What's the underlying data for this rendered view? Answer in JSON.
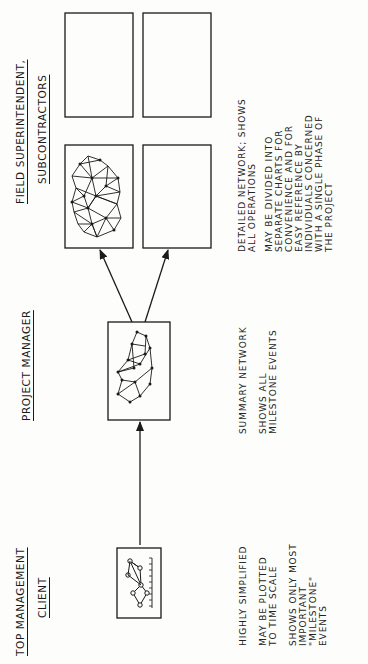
{
  "levels": [
    {
      "id": "client",
      "header_line1": "TOP MANAGEMENT",
      "header_line2": "CLIENT",
      "notes": [
        "HIGHLY SIMPLIFIED",
        "MAY BE PLOTTED\nTO TIME SCALE",
        "SHOWS ONLY MOST\nIMPORTANT\n\"MILESTONE\"\nEVENTS"
      ]
    },
    {
      "id": "project-manager",
      "header_line1": "PROJECT MANAGER",
      "notes": [
        "SUMMARY NETWORK",
        "SHOWS ALL\nMILESTONE EVENTS"
      ]
    },
    {
      "id": "field",
      "header_line1": "FIELD SUPERINTENDENT,",
      "header_line2": "SUBCONTRACTORS",
      "notes": [
        "DETAILED NETWORK; SHOWS\nALL OPERATIONS",
        "MAY BE DIVIDED INTO\nSEPARATE CHARTS FOR\nCONVENIENCE AND FOR\nEASY REFERENCE BY\nINDIVIDUALS CONCERNED\nWITH A SINGLE PHASE OF\nTHE PROJECT"
      ]
    }
  ],
  "diagram": {
    "orientation": "rotated 90 degrees counter-clockwise",
    "flow": [
      "client",
      "project-manager",
      "field"
    ],
    "field_chart_count": 4,
    "colors": {
      "ink": "#1a1a1a",
      "paper": "#fdfdfb"
    }
  }
}
